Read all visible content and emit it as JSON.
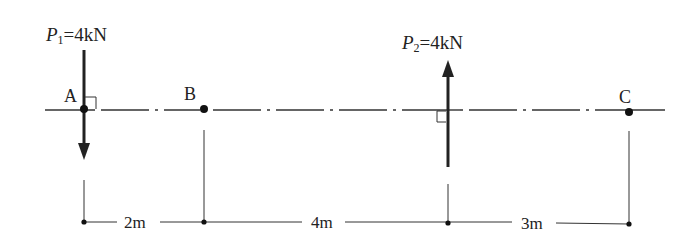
{
  "forces": [
    {
      "symbol": "P",
      "subscript": "1",
      "value": "=4kN",
      "direction": "down",
      "at_point": "A"
    },
    {
      "symbol": "P",
      "subscript": "2",
      "value": "=4kN",
      "direction": "up",
      "at_x_from_A_m": 6
    }
  ],
  "points": [
    {
      "label": "A"
    },
    {
      "label": "B"
    },
    {
      "label": "C"
    }
  ],
  "dimensions": [
    {
      "label": "2m"
    },
    {
      "label": "4m"
    },
    {
      "label": "3m"
    }
  ],
  "colors": {
    "ink": "#222222",
    "background": "#ffffff"
  }
}
